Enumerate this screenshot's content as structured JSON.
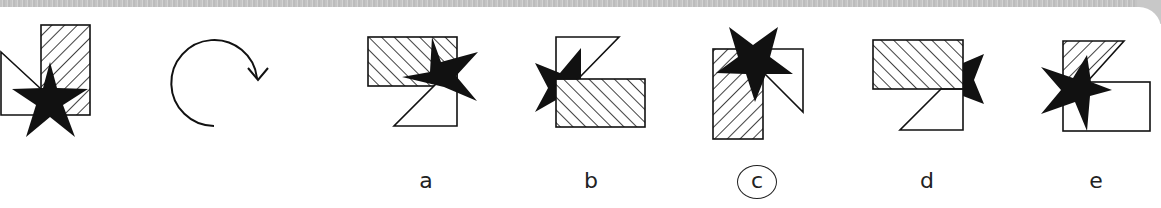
{
  "puzzle": {
    "type": "rotation",
    "question_figure": {
      "shapes": [
        "hatched-rectangle",
        "white-right-triangle",
        "black-five-point-star"
      ],
      "operation_icon": "clockwise-rotation-arrow-icon"
    },
    "options": [
      {
        "label": "a",
        "selected": false
      },
      {
        "label": "b",
        "selected": false
      },
      {
        "label": "c",
        "selected": true
      },
      {
        "label": "d",
        "selected": false
      },
      {
        "label": "e",
        "selected": false
      }
    ],
    "answer_mark": "circle"
  },
  "colors": {
    "ink": "#111111",
    "paper": "#ffffff",
    "band": "#c8c8c8"
  }
}
